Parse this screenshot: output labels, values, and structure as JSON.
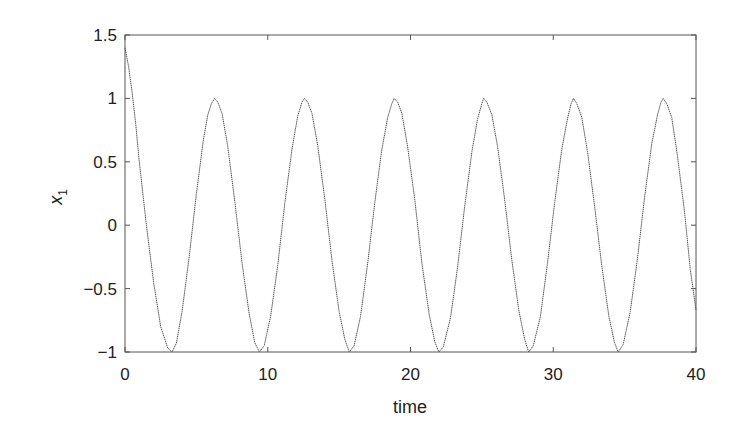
{
  "chart_data": {
    "type": "line",
    "title": "",
    "xlabel": "time",
    "ylabel": "x",
    "ylabel_subscript": "1",
    "xlim": [
      0,
      40
    ],
    "ylim": [
      -1,
      1.5
    ],
    "xticks": [
      0,
      10,
      20,
      30,
      40
    ],
    "xtick_labels": [
      "0",
      "10",
      "20",
      "30",
      "40"
    ],
    "yticks": [
      -1,
      -0.5,
      0,
      0.5,
      1,
      1.5
    ],
    "ytick_labels": [
      "−1",
      "−0.5",
      "0",
      "0.5",
      "1",
      "1.5"
    ],
    "grid": false,
    "legend": null,
    "line_color": "#555555",
    "series": [
      {
        "name": "x1",
        "x": [
          0,
          0.25,
          0.5,
          0.75,
          1,
          1.5,
          2,
          2.5,
          3,
          3.3,
          3.6,
          4,
          4.5,
          5,
          5.5,
          5.8,
          6.05,
          6.28,
          6.5,
          6.8,
          7.2,
          7.7,
          8.2,
          8.7,
          9.1,
          9.42,
          9.75,
          10.2,
          10.7,
          11.2,
          11.7,
          12.1,
          12.4,
          12.57,
          12.8,
          13.1,
          13.5,
          14,
          14.5,
          15,
          15.4,
          15.71,
          16.05,
          16.5,
          17,
          17.5,
          18,
          18.4,
          18.7,
          18.85,
          19.1,
          19.4,
          19.8,
          20.3,
          20.8,
          21.3,
          21.7,
          21.99,
          22.3,
          22.8,
          23.3,
          23.8,
          24.3,
          24.7,
          25,
          25.13,
          25.35,
          25.7,
          26.1,
          26.6,
          27.1,
          27.6,
          28,
          28.27,
          28.6,
          29.1,
          29.6,
          30.1,
          30.6,
          31,
          31.25,
          31.42,
          31.65,
          32,
          32.4,
          32.9,
          33.4,
          33.9,
          34.3,
          34.56,
          34.9,
          35.4,
          35.9,
          36.4,
          36.9,
          37.3,
          37.55,
          37.7,
          37.95,
          38.3,
          38.7,
          39.2,
          39.6,
          40
        ],
        "y": [
          1.4,
          1.25,
          1.05,
          0.8,
          0.5,
          0.0,
          -0.45,
          -0.8,
          -0.97,
          -1.0,
          -0.93,
          -0.68,
          -0.25,
          0.25,
          0.68,
          0.87,
          0.96,
          1.0,
          0.97,
          0.88,
          0.62,
          0.18,
          -0.3,
          -0.7,
          -0.93,
          -1.0,
          -0.95,
          -0.72,
          -0.32,
          0.18,
          0.6,
          0.86,
          0.97,
          1.0,
          0.97,
          0.88,
          0.63,
          0.2,
          -0.28,
          -0.68,
          -0.9,
          -1.0,
          -0.95,
          -0.72,
          -0.3,
          0.18,
          0.6,
          0.85,
          0.96,
          1.0,
          0.97,
          0.88,
          0.62,
          0.2,
          -0.3,
          -0.7,
          -0.92,
          -1.0,
          -0.96,
          -0.73,
          -0.33,
          0.15,
          0.58,
          0.84,
          0.96,
          1.0,
          0.97,
          0.87,
          0.62,
          0.2,
          -0.28,
          -0.68,
          -0.9,
          -1.0,
          -0.95,
          -0.72,
          -0.3,
          0.18,
          0.6,
          0.84,
          0.96,
          1.0,
          0.96,
          0.85,
          0.58,
          0.15,
          -0.32,
          -0.72,
          -0.93,
          -1.0,
          -0.94,
          -0.68,
          -0.26,
          0.22,
          0.64,
          0.87,
          0.97,
          1.0,
          0.96,
          0.85,
          0.55,
          0.1,
          -0.35,
          -0.67
        ]
      }
    ]
  }
}
